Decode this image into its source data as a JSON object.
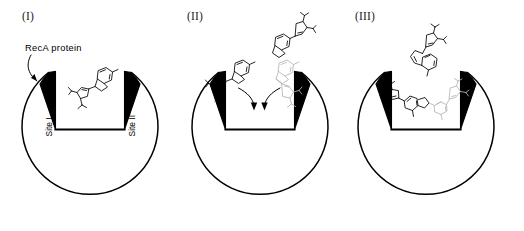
{
  "figure": {
    "background_color": "#ffffff",
    "stroke_color": "#000000",
    "faded_stroke_color": "#b4b4b4",
    "panel_count": 3
  },
  "panels": [
    {
      "id": "I",
      "label": "(I)",
      "annotations": {
        "protein_label": "RecA protein",
        "site_one_label": "Site I",
        "site_two_label": "Site II"
      },
      "molecules": [
        {
          "name": "ligand-bound-site-I",
          "state": "bound",
          "shade": "dark"
        }
      ],
      "arrows": [
        {
          "name": "recA-pointer-arrow",
          "style": "curved",
          "direction": "down-left"
        }
      ]
    },
    {
      "id": "II",
      "label": "(II)",
      "annotations": {
        "protein_label": "",
        "site_one_label": "",
        "site_two_label": ""
      },
      "molecules": [
        {
          "name": "ligand-entering-site-I",
          "state": "entering",
          "shade": "dark"
        },
        {
          "name": "ligand-entering-site-II",
          "state": "entering",
          "shade": "faded"
        },
        {
          "name": "ligand-free-upper",
          "state": "free",
          "shade": "dark"
        }
      ],
      "arrows": [
        {
          "name": "binding-arrow-left",
          "style": "curved",
          "direction": "down"
        },
        {
          "name": "binding-arrow-right",
          "style": "curved",
          "direction": "down"
        }
      ]
    },
    {
      "id": "III",
      "label": "(III)",
      "annotations": {
        "protein_label": "",
        "site_one_label": "",
        "site_two_label": ""
      },
      "molecules": [
        {
          "name": "ligand-dimer-in-cleft",
          "state": "bound-dimer",
          "shade": "dark-and-faded"
        },
        {
          "name": "ligand-free-upper",
          "state": "free",
          "shade": "dark"
        }
      ],
      "arrows": []
    }
  ],
  "colors": {
    "ink": "#000000",
    "faded_ink": "#b4b4b4",
    "mid_ink": "#6e6e6e",
    "paper": "#ffffff"
  }
}
